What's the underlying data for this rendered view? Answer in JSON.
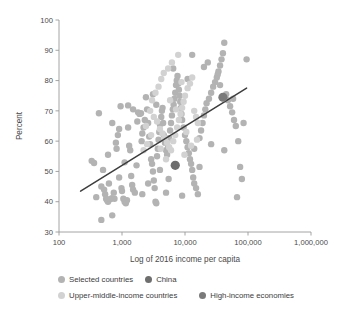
{
  "chart_data": {
    "type": "scatter",
    "title": "",
    "xlabel": "Log of 2016 income per capita",
    "ylabel": "Percent",
    "xscale": "log",
    "xlim": [
      100,
      1000000
    ],
    "ylim": [
      30,
      100
    ],
    "xticks": [
      100,
      1000,
      10000,
      100000,
      1000000
    ],
    "xticklabels": [
      "100",
      "1,000",
      "10,000",
      "100,000",
      "1,000,000"
    ],
    "yticks": [
      30,
      40,
      50,
      60,
      70,
      80,
      90,
      100
    ],
    "yticklabels": [
      "30",
      "40",
      "50",
      "60",
      "70",
      "80",
      "90",
      "100"
    ],
    "grid": false,
    "legend_position": "below",
    "legend": [
      {
        "label": "Selected countries",
        "color": "#b3b3b3"
      },
      {
        "label": "China",
        "color": "#6e6e6e"
      },
      {
        "label": "Upper-middle-income countries",
        "color": "#d2d2d2"
      },
      {
        "label": "High-income economies",
        "color": "#7a7a7a"
      }
    ],
    "trend_line": {
      "name": "fitted trend",
      "color": "#3d3d3d",
      "x": [
        220,
        95000
      ],
      "y": [
        43.5,
        77.5
      ]
    },
    "series": [
      {
        "name": "Selected countries",
        "color": "#b3b3b3",
        "marker": "circle",
        "points": [
          [
            330,
            53.5
          ],
          [
            360,
            52.8
          ],
          [
            390,
            41.5
          ],
          [
            430,
            69.2
          ],
          [
            470,
            34.0
          ],
          [
            470,
            45.0
          ],
          [
            500,
            50.5
          ],
          [
            520,
            44.0
          ],
          [
            540,
            42.5
          ],
          [
            560,
            41.0
          ],
          [
            580,
            40.5
          ],
          [
            600,
            40.0
          ],
          [
            620,
            46.0
          ],
          [
            650,
            40.8
          ],
          [
            690,
            41.2
          ],
          [
            700,
            35.5
          ],
          [
            740,
            43.0
          ],
          [
            760,
            41.0
          ],
          [
            800,
            59.5
          ],
          [
            820,
            57.5
          ],
          [
            860,
            62.0
          ],
          [
            900,
            64.0
          ],
          [
            950,
            71.5
          ],
          [
            980,
            44.5
          ],
          [
            1000,
            43.5
          ],
          [
            1050,
            41.0
          ],
          [
            1100,
            40.0
          ],
          [
            1150,
            39.5
          ],
          [
            1200,
            40.5
          ],
          [
            1250,
            71.8
          ],
          [
            1300,
            58.5
          ],
          [
            1350,
            57.0
          ],
          [
            1400,
            48.5
          ],
          [
            1450,
            45.5
          ],
          [
            1500,
            44.0
          ],
          [
            1600,
            43.0
          ],
          [
            1700,
            52.0
          ],
          [
            1750,
            66.5
          ],
          [
            1800,
            69.5
          ],
          [
            1900,
            69.0
          ],
          [
            2000,
            69.2
          ],
          [
            2050,
            60.0
          ],
          [
            2100,
            62.5
          ],
          [
            2200,
            64.5
          ],
          [
            2300,
            67.0
          ],
          [
            2400,
            74.5
          ],
          [
            2500,
            70.5
          ],
          [
            2600,
            66.0
          ],
          [
            2700,
            61.5
          ],
          [
            2800,
            59.0
          ],
          [
            2900,
            54.0
          ],
          [
            3000,
            52.5
          ],
          [
            3100,
            50.0
          ],
          [
            3200,
            47.0
          ],
          [
            3300,
            44.5
          ],
          [
            3400,
            40.0
          ],
          [
            3500,
            39.5
          ],
          [
            3600,
            55.0
          ],
          [
            3700,
            57.5
          ],
          [
            3800,
            60.5
          ],
          [
            3900,
            63.0
          ],
          [
            4000,
            65.5
          ],
          [
            4200,
            68.0
          ],
          [
            4300,
            70.0
          ],
          [
            4400,
            71.0
          ],
          [
            4500,
            66.0
          ],
          [
            4600,
            62.0
          ],
          [
            4800,
            59.5
          ],
          [
            5000,
            57.0
          ],
          [
            5200,
            55.5
          ],
          [
            5400,
            58.0
          ],
          [
            5600,
            61.0
          ],
          [
            5800,
            63.5
          ],
          [
            6000,
            66.0
          ],
          [
            6200,
            68.5
          ],
          [
            6400,
            70.5
          ],
          [
            6600,
            72.0
          ],
          [
            6800,
            74.0
          ],
          [
            7000,
            76.0
          ],
          [
            7200,
            78.5
          ],
          [
            7400,
            80.0
          ],
          [
            7600,
            81.5
          ],
          [
            7800,
            79.0
          ],
          [
            8000,
            77.0
          ],
          [
            8200,
            75.0
          ],
          [
            8400,
            73.0
          ],
          [
            8600,
            71.0
          ],
          [
            8800,
            69.0
          ],
          [
            9000,
            67.0
          ],
          [
            9500,
            64.5
          ],
          [
            10000,
            62.0
          ],
          [
            10500,
            60.0
          ],
          [
            11000,
            58.0
          ],
          [
            11500,
            56.0
          ],
          [
            12000,
            54.0
          ],
          [
            12500,
            52.5
          ],
          [
            13000,
            50.5
          ],
          [
            13500,
            48.0
          ],
          [
            14000,
            46.0
          ],
          [
            15000,
            44.5
          ],
          [
            16000,
            42.5
          ],
          [
            17000,
            61.0
          ],
          [
            18000,
            63.5
          ],
          [
            19000,
            66.0
          ],
          [
            20000,
            68.5
          ],
          [
            21000,
            70.5
          ],
          [
            22000,
            72.5
          ],
          [
            24000,
            74.0
          ],
          [
            26000,
            76.0
          ],
          [
            28000,
            78.0
          ],
          [
            30000,
            79.5
          ],
          [
            32000,
            81.0
          ],
          [
            34000,
            83.0
          ],
          [
            36000,
            85.0
          ],
          [
            38000,
            87.0
          ],
          [
            40000,
            89.0
          ],
          [
            42000,
            92.5
          ],
          [
            45000,
            75.5
          ],
          [
            48000,
            73.5
          ],
          [
            52000,
            71.5
          ],
          [
            56000,
            69.5
          ],
          [
            60000,
            67.0
          ],
          [
            64000,
            65.0
          ],
          [
            70000,
            60.0
          ],
          [
            75000,
            51.5
          ],
          [
            80000,
            47.5
          ],
          [
            85000,
            66.0
          ],
          [
            95000,
            87.0
          ],
          [
            67000,
            41.5
          ],
          [
            700,
            66.0
          ],
          [
            1250,
            64.5
          ],
          [
            2100,
            42.5
          ],
          [
            3500,
            72.0
          ],
          [
            5000,
            43.0
          ],
          [
            9000,
            42.0
          ],
          [
            14000,
            57.5
          ],
          [
            26000,
            59.0
          ],
          [
            42000,
            57.0
          ],
          [
            600,
            55.5
          ],
          [
            1500,
            70.5
          ],
          [
            4000,
            50.5
          ],
          [
            11000,
            80.5
          ],
          [
            20000,
            84.5
          ],
          [
            33000,
            82.0
          ],
          [
            17000,
            51.5
          ],
          [
            5500,
            47.5
          ],
          [
            2600,
            46.0
          ],
          [
            900,
            48.0
          ],
          [
            1100,
            53.0
          ],
          [
            3100,
            75.5
          ],
          [
            6500,
            84.0
          ],
          [
            13000,
            88.5
          ],
          [
            23000,
            86.0
          ],
          [
            36000,
            78.5
          ],
          [
            58000,
            74.0
          ]
        ]
      },
      {
        "name": "Upper-middle-income countries",
        "color": "#d2d2d2",
        "marker": "circle",
        "points": [
          [
            2800,
            70.0
          ],
          [
            3200,
            68.0
          ],
          [
            3600,
            66.5
          ],
          [
            4000,
            64.0
          ],
          [
            4400,
            62.5
          ],
          [
            4800,
            61.0
          ],
          [
            5200,
            59.5
          ],
          [
            5600,
            58.0
          ],
          [
            6000,
            57.0
          ],
          [
            6500,
            60.0
          ],
          [
            7000,
            62.0
          ],
          [
            7500,
            64.5
          ],
          [
            8000,
            67.0
          ],
          [
            8500,
            69.0
          ],
          [
            9000,
            71.0
          ],
          [
            9500,
            73.0
          ],
          [
            10000,
            75.0
          ],
          [
            11000,
            77.5
          ],
          [
            12000,
            79.0
          ],
          [
            13000,
            81.0
          ],
          [
            14000,
            70.0
          ],
          [
            15000,
            68.0
          ],
          [
            16000,
            66.0
          ],
          [
            3000,
            73.5
          ],
          [
            3400,
            76.0
          ],
          [
            3800,
            78.0
          ],
          [
            4200,
            80.5
          ],
          [
            4600,
            82.5
          ],
          [
            5400,
            84.0
          ],
          [
            6200,
            86.0
          ],
          [
            7800,
            88.5
          ],
          [
            2500,
            59.0
          ],
          [
            2200,
            57.0
          ],
          [
            5000,
            54.0
          ],
          [
            6800,
            52.0
          ],
          [
            9800,
            55.5
          ],
          [
            12500,
            58.5
          ],
          [
            2900,
            62.0
          ],
          [
            4100,
            57.5
          ],
          [
            7200,
            70.5
          ],
          [
            10500,
            63.0
          ],
          [
            15500,
            60.5
          ],
          [
            2400,
            65.0
          ],
          [
            5800,
            73.5
          ],
          [
            8800,
            79.5
          ]
        ]
      },
      {
        "name": "China",
        "color": "#6e6e6e",
        "marker": "circle-large",
        "points": [
          [
            7000,
            52.0
          ]
        ]
      },
      {
        "name": "High-income economies",
        "color": "#7a7a7a",
        "marker": "circle-large",
        "points": [
          [
            40000,
            74.5
          ]
        ]
      }
    ]
  },
  "axis": {
    "ylabel": "Percent",
    "xlabel": "Log of 2016 income per capita"
  },
  "legend": {
    "items": [
      {
        "label": "Selected countries",
        "color": "#b3b3b3"
      },
      {
        "label": "China",
        "color": "#6e6e6e"
      },
      {
        "label": "Upper-middle-income countries",
        "color": "#d2d2d2"
      },
      {
        "label": "High-income economies",
        "color": "#7a7a7a"
      }
    ]
  }
}
